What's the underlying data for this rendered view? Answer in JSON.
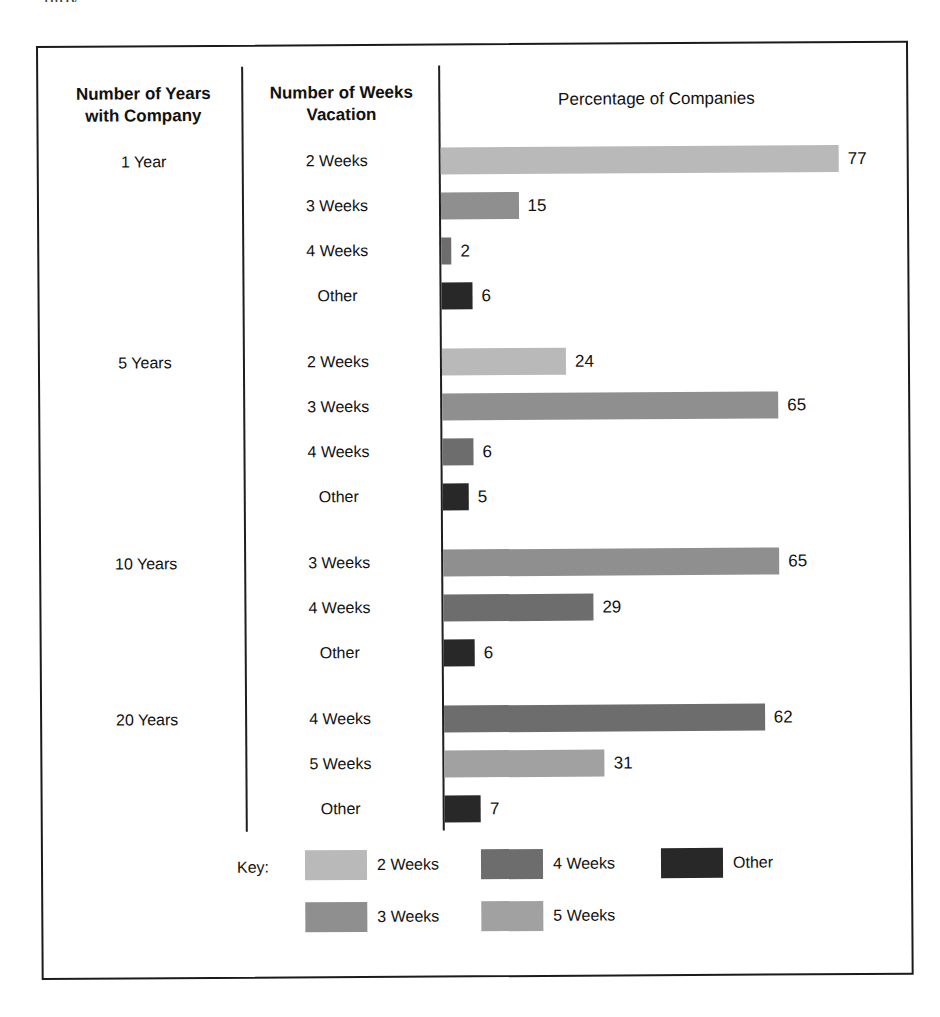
{
  "scan_artifact_text": "ploy",
  "headers": {
    "years_column": "Number of Years\nwith Company",
    "years_column_line1": "Number of Years",
    "years_column_line2": "with Company",
    "weeks_column_line1": "Number of Weeks",
    "weeks_column_line2": "Vacation",
    "value_column": "Percentage of Companies"
  },
  "legend": {
    "key_label": "Key:",
    "items": [
      {
        "label": "2 Weeks",
        "color": "#b9b9b9"
      },
      {
        "label": "3 Weeks",
        "color": "#8f8f8f"
      },
      {
        "label": "4 Weeks",
        "color": "#6d6d6d"
      },
      {
        "label": "5 Weeks",
        "color": "#a1a1a1"
      },
      {
        "label": "Other",
        "color": "#282828"
      }
    ]
  },
  "chart_data": {
    "type": "bar",
    "title": "Percentage of Companies",
    "xlabel": "Percentage of Companies",
    "ylabel": "Number of Years with Company / Number of Weeks Vacation",
    "orientation": "horizontal",
    "xlim": [
      0,
      80
    ],
    "grid": false,
    "legend_position": "bottom",
    "value_labels": true,
    "groups": [
      {
        "group_label": "1 Year",
        "bars": [
          {
            "category": "2 Weeks",
            "value": 77,
            "color": "#b9b9b9"
          },
          {
            "category": "3 Weeks",
            "value": 15,
            "color": "#8f8f8f"
          },
          {
            "category": "4 Weeks",
            "value": 2,
            "color": "#6d6d6d"
          },
          {
            "category": "Other",
            "value": 6,
            "color": "#282828"
          }
        ]
      },
      {
        "group_label": "5 Years",
        "bars": [
          {
            "category": "2 Weeks",
            "value": 24,
            "color": "#b9b9b9"
          },
          {
            "category": "3 Weeks",
            "value": 65,
            "color": "#8f8f8f"
          },
          {
            "category": "4 Weeks",
            "value": 6,
            "color": "#6d6d6d"
          },
          {
            "category": "Other",
            "value": 5,
            "color": "#282828"
          }
        ]
      },
      {
        "group_label": "10 Years",
        "bars": [
          {
            "category": "3 Weeks",
            "value": 65,
            "color": "#8f8f8f"
          },
          {
            "category": "4 Weeks",
            "value": 29,
            "color": "#6d6d6d"
          },
          {
            "category": "Other",
            "value": 6,
            "color": "#282828"
          }
        ]
      },
      {
        "group_label": "20 Years",
        "bars": [
          {
            "category": "4 Weeks",
            "value": 62,
            "color": "#6d6d6d"
          },
          {
            "category": "5 Weeks",
            "value": 31,
            "color": "#a1a1a1"
          },
          {
            "category": "Other",
            "value": 7,
            "color": "#282828"
          }
        ]
      }
    ]
  }
}
